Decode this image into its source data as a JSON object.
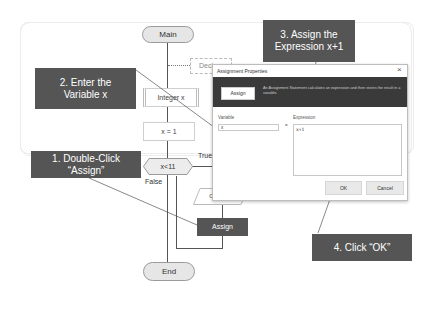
{
  "flowchart": {
    "start": "Main",
    "declare": "Declare",
    "integer": "Integer x",
    "assign_init": "x = 1",
    "condition": "x<11",
    "true_label": "True",
    "false_label": "False",
    "output": "Output x",
    "assign": "Assign",
    "end": "End"
  },
  "callouts": {
    "step1": "1. Double-Click “Assign”",
    "step2": "2. Enter the Variable x",
    "step3": "3. Assign the Expression x+1",
    "step4": "4. Click “OK”"
  },
  "dialog": {
    "title": "Assignment Properties",
    "close": "×",
    "banner_button": "Assign",
    "description": "An Assignment Statement calculates an expression and then stores the result in a variable.",
    "variable_label": "Variable",
    "variable_value": "x",
    "equals": "=",
    "expression_label": "Expression",
    "expression_value": "x+1",
    "ok": "OK",
    "cancel": "Cancel"
  },
  "colors": {
    "callout_bg": "#555555",
    "assign_block": "#555555",
    "dialog_banner": "#3a3a3a"
  }
}
